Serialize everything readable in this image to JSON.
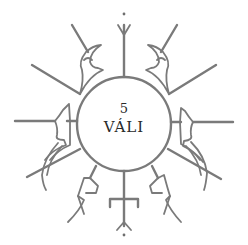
{
  "emblem": {
    "number": "5",
    "name": "VÁLI",
    "colors": {
      "stroke": "#7a7a7a",
      "text": "#2a2a2a",
      "background": "#ffffff"
    }
  }
}
